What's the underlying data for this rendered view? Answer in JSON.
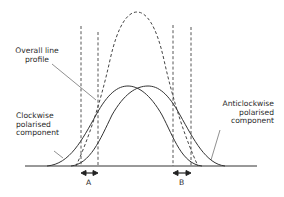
{
  "figure": {
    "labels": {
      "overall": "Overall line\nprofile",
      "clockwise": "Clockwise\npolarised\ncomponent",
      "anticlockwise": "Anticlockwise\npolarised\ncomponent",
      "a": "A",
      "b": "B"
    },
    "colors": {
      "line": "#333333",
      "background": "#ffffff"
    },
    "elements": {
      "baseline": "horizontal axis",
      "dashed_envelope": "overall line profile (sum of components)",
      "solid_curve_left": "clockwise polarised component",
      "solid_curve_right": "anticlockwise polarised component",
      "dashed_verticals": 4,
      "double_arrows": [
        "A",
        "B"
      ]
    }
  }
}
